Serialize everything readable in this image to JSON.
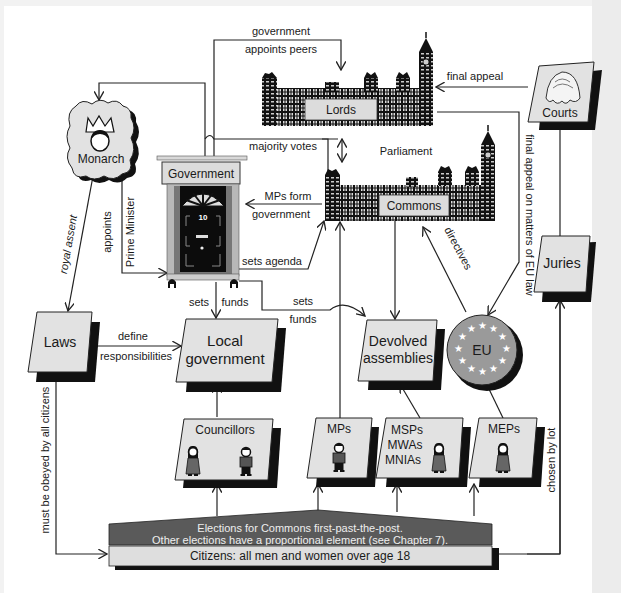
{
  "diagram": {
    "nodes": {
      "monarch": {
        "label": "Monarch"
      },
      "government": {
        "label": "Government",
        "door_number": "10"
      },
      "lords": {
        "label": "Lords"
      },
      "commons": {
        "label": "Commons"
      },
      "parliament": {
        "label": "Parliament"
      },
      "courts": {
        "label": "Courts"
      },
      "juries": {
        "label": "Juries"
      },
      "laws": {
        "label": "Laws"
      },
      "local_government": {
        "line1": "Local",
        "line2": "government"
      },
      "devolved_assemblies": {
        "line1": "Devolved",
        "line2": "assemblies"
      },
      "eu": {
        "label": "EU"
      },
      "councillors": {
        "label": "Councillors"
      },
      "mps": {
        "label": "MPs"
      },
      "msps": {
        "line1": "MSPs",
        "line2": "MWAs",
        "line3": "MNIAs"
      },
      "meps": {
        "label": "MEPs"
      },
      "elections": {
        "line1": "Elections for Commons first-past-the-post.",
        "line2": "Other elections have a proportional element (see Chapter 7)."
      },
      "citizens": {
        "label": "Citizens: all men and women over age 18"
      }
    },
    "edges": {
      "gov_appoints_peers_1": "government",
      "gov_appoints_peers_2": "appoints peers",
      "final_appeal": "final appeal",
      "majority_votes": "majority votes",
      "mps_form_1": "MPs form",
      "mps_form_2": "government",
      "royal_assent": "royal assent",
      "appoints": "appoints",
      "prime_minister": "Prime Minister",
      "sets_agenda": "sets agenda",
      "sets": "sets",
      "funds": "funds",
      "sets2": "sets",
      "funds2": "funds",
      "define": "define",
      "responsibilities": "responsibilities",
      "directives": "directives",
      "final_appeal_eu": "final appeal on matters of EU law",
      "chosen_by_lot": "chosen by lot",
      "must_be_obeyed": "must be obeyed by all citizens"
    },
    "colors": {
      "box_fill": "#e2e2e2",
      "shadow": "#111111",
      "elections_fill": "#5a5a5a",
      "citizens_fill": "#dedede",
      "eu_fill": "#9a9a9a",
      "line": "#222222"
    }
  }
}
